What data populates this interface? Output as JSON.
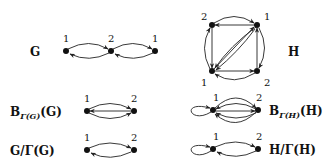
{
  "graphs": {
    "G": {
      "label": "G",
      "node_labels": [
        "1",
        "2",
        "1"
      ]
    },
    "H": {
      "label": "H",
      "node_labels": [
        "2",
        "1",
        "1",
        "2"
      ]
    },
    "BG": {
      "label_main": "B",
      "label_sub": "Γ(G)",
      "label_tail": "(G)",
      "node_labels": [
        "1",
        "2"
      ]
    },
    "GQ": {
      "label": "G/Γ(G)",
      "node_labels": [
        "1",
        "2"
      ]
    },
    "BH": {
      "label_main": "B",
      "label_sub": "Γ(H)",
      "label_tail": "(H)",
      "node_labels": [
        "1",
        "2"
      ]
    },
    "HQ": {
      "label": "H/Γ(H)",
      "node_labels": [
        "1",
        "2"
      ]
    }
  }
}
